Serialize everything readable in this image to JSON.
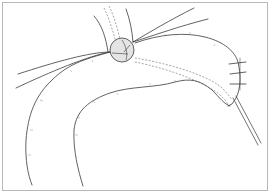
{
  "figure": {
    "colors": {
      "line": "#3a3a3a",
      "dashed": "#6a6a6a",
      "frame": "#b8b8b8",
      "anastomosis_fill": "#e4e4e4"
    }
  }
}
